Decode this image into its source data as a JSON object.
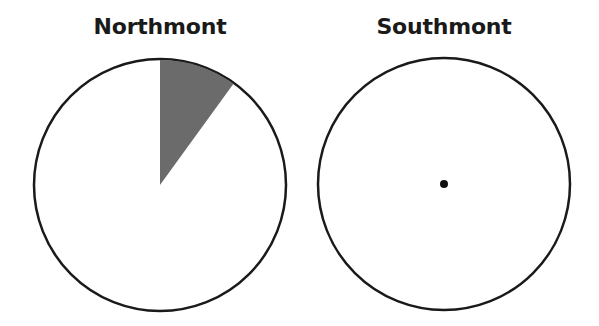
{
  "chart_data": [
    {
      "type": "pie",
      "title": "Northmont",
      "center": [
        160,
        185
      ],
      "radius": 126,
      "slices": [
        {
          "label": "shaded",
          "percent": 10,
          "start_deg": 0,
          "end_deg": 36,
          "color": "#6b6b6b"
        },
        {
          "label": "unshaded",
          "percent": 90,
          "start_deg": 36,
          "end_deg": 360,
          "color": "#ffffff"
        }
      ]
    },
    {
      "type": "pie",
      "title": "Southmont",
      "center": [
        444,
        184
      ],
      "radius": 126,
      "slices": [
        {
          "label": "unshaded",
          "percent": 100,
          "color": "#ffffff"
        }
      ],
      "annotations": [
        {
          "type": "center-dot",
          "x": 444,
          "y": 184,
          "r": 4,
          "color": "#111111"
        }
      ]
    }
  ],
  "colors": {
    "outline": "#1a1a1a",
    "shade": "#6b6b6b",
    "background": "#ffffff"
  }
}
